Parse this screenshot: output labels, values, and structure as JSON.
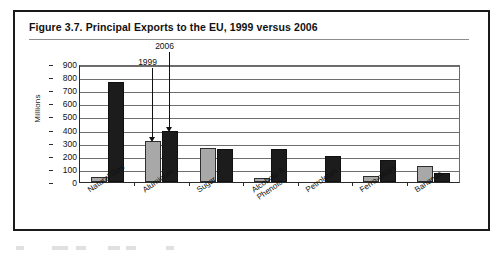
{
  "figure": {
    "title": "Figure 3.7.  Principal Exports to the EU, 1999 versus 2006"
  },
  "chart_data": {
    "type": "bar",
    "title": "Figure 3.7.  Principal Exports to the EU, 1999 versus 2006",
    "xlabel": "",
    "ylabel": "Millions",
    "ylim": [
      0,
      900
    ],
    "yticks": [
      0,
      100,
      200,
      300,
      400,
      500,
      600,
      700,
      800,
      900
    ],
    "ytick_labels": [
      "0",
      "100",
      "200",
      "300",
      "400",
      "500",
      "600",
      "700",
      "800",
      "900"
    ],
    "grid": true,
    "legend_position": "none",
    "categories": [
      "Natural Gas",
      "Aluminum",
      "Sugar",
      "Alcohols &\nPhenols",
      "Petroleum",
      "Ferro-alloys",
      "Bananas"
    ],
    "series": [
      {
        "name": "1999",
        "color": "#a8a8a8",
        "values": [
          40,
          315,
          260,
          32,
          0,
          45,
          120
        ]
      },
      {
        "name": "2006",
        "color": "#1c1c1c",
        "values": [
          765,
          390,
          252,
          253,
          200,
          165,
          70
        ]
      }
    ],
    "annotations": [
      {
        "label": "1999",
        "target_series": "1999",
        "target_category": "Aluminum"
      },
      {
        "label": "2006",
        "target_series": "2006",
        "target_category": "Aluminum"
      }
    ]
  }
}
